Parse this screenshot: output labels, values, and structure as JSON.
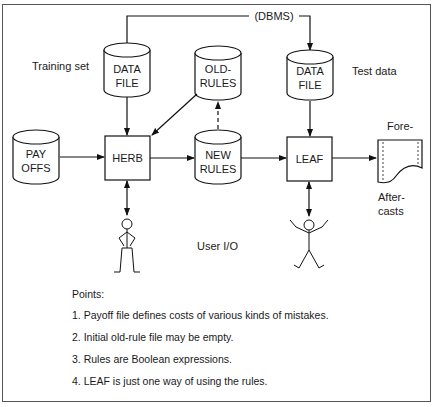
{
  "diagram": {
    "dbms_label": "(DBMS)",
    "training_set_label": "Training set",
    "test_data_label": "Test data",
    "user_io_label": "User I/O",
    "nodes": {
      "data_file_training": "DATA\nFILE",
      "old_rules": "OLD-\nRULES",
      "data_file_test": "DATA\nFILE",
      "payoffs": "PAY\nOFFS",
      "herb": "HERB",
      "new_rules": "NEW\nRULES",
      "leaf": "LEAF"
    },
    "output_labels": {
      "fore": "Fore-",
      "after": "After-\ncasts"
    },
    "edges": [
      {
        "from": "data_file_training",
        "to": "herb",
        "style": "solid"
      },
      {
        "from": "old_rules",
        "to": "herb",
        "style": "solid"
      },
      {
        "from": "payoffs",
        "to": "herb",
        "style": "solid"
      },
      {
        "from": "herb",
        "to": "new_rules",
        "style": "solid"
      },
      {
        "from": "new_rules",
        "to": "old_rules",
        "style": "dashed"
      },
      {
        "from": "new_rules",
        "to": "leaf",
        "style": "solid"
      },
      {
        "from": "data_file_test",
        "to": "leaf",
        "style": "solid"
      },
      {
        "from": "leaf",
        "to": "forecasts_document",
        "style": "solid"
      },
      {
        "from": "herb",
        "to": "user_figure_1",
        "style": "bidirectional"
      },
      {
        "from": "leaf",
        "to": "user_figure_2",
        "style": "bidirectional"
      },
      {
        "from": "data_file_training",
        "to": "data_file_test",
        "style": "solid",
        "label": "(DBMS)"
      }
    ]
  },
  "points": {
    "title": "Points:",
    "items": [
      "1.  Payoff file defines costs of various kinds of mistakes.",
      "2.  Initial old-rule file may be empty.",
      "3.  Rules are Boolean expressions.",
      "4.  LEAF is just one way of using the rules."
    ]
  }
}
